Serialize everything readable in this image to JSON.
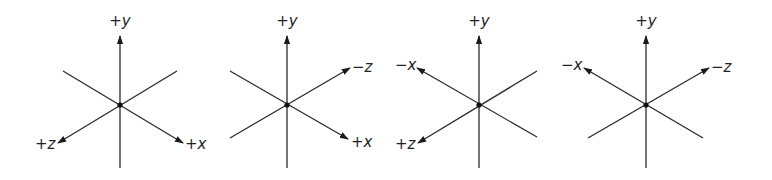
{
  "figure": {
    "panels": [
      {
        "center": [
          120,
          105
        ],
        "axes": [
          {
            "label_sign": "+",
            "label_var": "y",
            "tip": [
              120,
              36
            ],
            "tail": [
              120,
              168
            ],
            "arrow": true,
            "label_pos": [
              120,
              26
            ],
            "anchor": "middle"
          },
          {
            "label_sign": "+",
            "label_var": "z",
            "tip": [
              58,
              143
            ],
            "tail": [
              177,
              71
            ],
            "arrow": true,
            "label_pos": [
              35,
              149
            ],
            "anchor": "start"
          },
          {
            "label_sign": "+",
            "label_var": "x",
            "tip": [
              183,
              143
            ],
            "tail": [
              63,
              71
            ],
            "arrow": true,
            "label_pos": [
              185,
              149
            ],
            "anchor": "start"
          }
        ]
      },
      {
        "center": [
          287,
          105
        ],
        "axes": [
          {
            "label_sign": "+",
            "label_var": "y",
            "tip": [
              287,
              36
            ],
            "tail": [
              287,
              168
            ],
            "arrow": true,
            "label_pos": [
              287,
              26
            ],
            "anchor": "middle"
          },
          {
            "label_sign": "−",
            "label_var": "z",
            "tip": [
              350,
              68
            ],
            "tail": [
              230,
              138
            ],
            "arrow": true,
            "label_pos": [
              352,
              72
            ],
            "anchor": "start"
          },
          {
            "label_sign": "+",
            "label_var": "x",
            "tip": [
              348,
              139
            ],
            "tail": [
              230,
              71
            ],
            "arrow": true,
            "label_pos": [
              351,
              147
            ],
            "anchor": "start"
          }
        ]
      },
      {
        "center": [
          479,
          105
        ],
        "axes": [
          {
            "label_sign": "+",
            "label_var": "y",
            "tip": [
              479,
              36
            ],
            "tail": [
              479,
              168
            ],
            "arrow": true,
            "label_pos": [
              479,
              26
            ],
            "anchor": "middle"
          },
          {
            "label_sign": "−",
            "label_var": "x",
            "tip": [
              417,
              68
            ],
            "tail": [
              537,
              137
            ],
            "arrow": true,
            "label_pos": [
              395,
              70
            ],
            "anchor": "start"
          },
          {
            "label_sign": "+",
            "label_var": "z",
            "tip": [
              418,
              143
            ],
            "tail": [
              537,
              71
            ],
            "arrow": true,
            "label_pos": [
              395,
              149
            ],
            "anchor": "start"
          }
        ]
      },
      {
        "center": [
          646,
          105
        ],
        "axes": [
          {
            "label_sign": "+",
            "label_var": "y",
            "tip": [
              646,
              36
            ],
            "tail": [
              646,
              168
            ],
            "arrow": true,
            "label_pos": [
              646,
              26
            ],
            "anchor": "middle"
          },
          {
            "label_sign": "−",
            "label_var": "x",
            "tip": [
              584,
              68
            ],
            "tail": [
              703,
              138
            ],
            "arrow": true,
            "label_pos": [
              561,
              70
            ],
            "anchor": "start"
          },
          {
            "label_sign": "−",
            "label_var": "z",
            "tip": [
              709,
              68
            ],
            "tail": [
              588,
              138
            ],
            "arrow": true,
            "label_pos": [
              711,
              72
            ],
            "anchor": "start"
          }
        ]
      }
    ]
  }
}
